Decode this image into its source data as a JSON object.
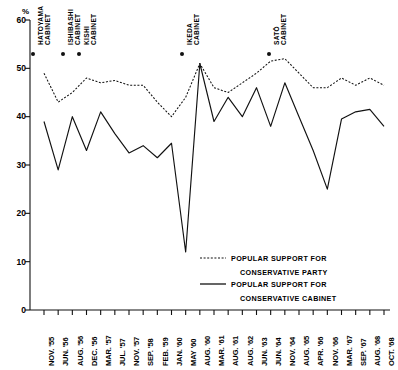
{
  "chart_data": {
    "type": "line",
    "title": "",
    "xlabel": "",
    "ylabel": "%",
    "ylim": [
      0,
      60
    ],
    "yticks": [
      0,
      10,
      20,
      30,
      40,
      50,
      60
    ],
    "grid": false,
    "legend_position": "inside-lower-right",
    "categories": [
      "NOV. '55",
      "JUN. '56",
      "AUG. '56",
      "DEC. '56",
      "MAR. '57",
      "JUL. '57",
      "NOV. '57",
      "SEP. '58",
      "FEB. '59",
      "JAN. '60",
      "MAY '60",
      "AUG. '60",
      "MAR. '61",
      "AUG. '61",
      "AUG. '62",
      "JUN. '63",
      "JUN. '64",
      "NOV. '64",
      "AUG. '65",
      "APR. '66",
      "NOV. '66",
      "MAR. '67",
      "SEP. '67",
      "AUG. '68",
      "OCT. '68"
    ],
    "series": [
      {
        "name": "POPULAR SUPPORT FOR CONSERVATIVE PARTY",
        "style": "dotted",
        "values": [
          49,
          43,
          45,
          48,
          47,
          47.5,
          46.5,
          46.5,
          43,
          40,
          44,
          51,
          46,
          45,
          47,
          49,
          51.5,
          52,
          49,
          46,
          46,
          48,
          46.5,
          48,
          46.5
        ]
      },
      {
        "name": "POPULAR SUPPORT FOR CONSERVATIVE CABINET",
        "style": "solid",
        "values": [
          39,
          29,
          40,
          33,
          41,
          36.5,
          32.5,
          34,
          31.5,
          34.5,
          12,
          51,
          39,
          44,
          40,
          46,
          38,
          47,
          40,
          33,
          25,
          39.5,
          41,
          41.5,
          38
        ]
      }
    ],
    "annotations": [
      {
        "label_lines": [
          "HATOYAMA",
          "CABINET"
        ],
        "tick_index": 0
      },
      {
        "label_lines": [
          "ISHIBASHI",
          "CABINET"
        ],
        "tick_index": 2
      },
      {
        "label_lines": [
          "KISHI",
          "CABINET"
        ],
        "tick_index": 3
      },
      {
        "label_lines": [
          "IKEDA",
          "CABINET"
        ],
        "tick_index": 11
      },
      {
        "label_lines": [
          "SATŌ",
          "CABINET"
        ],
        "tick_index": 17
      }
    ],
    "cabinet_markers": [
      {
        "x": 33
      },
      {
        "x": 63
      },
      {
        "x": 79
      },
      {
        "x": 182
      },
      {
        "x": 269
      }
    ]
  },
  "legend": {
    "entries": [
      {
        "line1": "POPULAR SUPPORT FOR",
        "line2": "CONSERVATIVE PARTY",
        "style": "dotted"
      },
      {
        "line1": "POPULAR SUPPORT FOR",
        "line2": "CONSERVATIVE CABINET",
        "style": "solid"
      }
    ]
  },
  "axis": {
    "unit_label": "%",
    "ytick_labels": [
      "60",
      "50",
      "40",
      "30",
      "20",
      "10",
      "0"
    ]
  },
  "colors": {
    "ink": "#111111",
    "background": "#ffffff"
  }
}
